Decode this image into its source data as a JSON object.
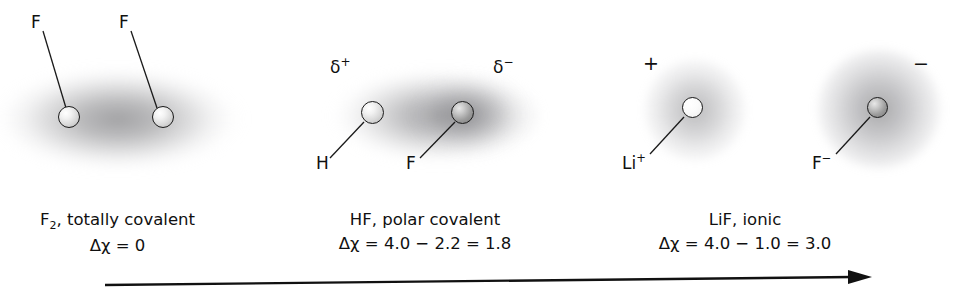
{
  "figure": {
    "background_color": "#ffffff",
    "ink_color": "#101010"
  },
  "panels": [
    {
      "id": "f2",
      "molecule": "F2",
      "bond_type": "totally covalent",
      "caption_line1": "F2, totally covalent",
      "caption_line1_formula_prefix": "F",
      "caption_line1_formula_sub": "2",
      "caption_line1_rest": ", totally covalent",
      "caption_line2": "Δχ = 0",
      "electronegativity_difference": 0,
      "cloud_shape": "single symmetric ellipse",
      "atoms": [
        {
          "label": "F",
          "charge_label": "",
          "shade": "light"
        },
        {
          "label": "F",
          "charge_label": "",
          "shade": "light"
        }
      ],
      "charge_labels": []
    },
    {
      "id": "hf",
      "molecule": "HF",
      "bond_type": "polar covalent",
      "caption_line1": "HF, polar covalent",
      "caption_line2": "Δχ = 4.0 − 2.2 = 1.8",
      "electronegativity_values": [
        4.0,
        2.2
      ],
      "electronegativity_difference": 1.8,
      "cloud_shape": "single ellipse, denser toward fluorine",
      "atoms": [
        {
          "label": "H",
          "charge_label": "δ+",
          "shade": "light"
        },
        {
          "label": "F",
          "charge_label": "δ−",
          "shade": "dark"
        }
      ],
      "charge_labels": [
        {
          "symbol": "δ",
          "sign": "+"
        },
        {
          "symbol": "δ",
          "sign": "−"
        }
      ]
    },
    {
      "id": "lif",
      "molecule": "LiF",
      "bond_type": "ionic",
      "caption_line1": "LiF, ionic",
      "caption_line2": "Δχ = 4.0 − 1.0 = 3.0",
      "electronegativity_values": [
        4.0,
        1.0
      ],
      "electronegativity_difference": 3.0,
      "cloud_shape": "two separate spherical ion clouds",
      "atoms": [
        {
          "label": "Li",
          "charge_label": "+",
          "shade": "hollow"
        },
        {
          "label": "F",
          "charge_label": "−",
          "shade": "dark"
        }
      ],
      "charge_labels": [
        {
          "symbol": "",
          "sign": "+"
        },
        {
          "symbol": "",
          "sign": "−"
        }
      ]
    }
  ],
  "atom_labels": {
    "f2_left": "F",
    "f2_right": "F",
    "hf_left": "H",
    "hf_right": "F",
    "lif_left_base": "Li",
    "lif_left_sup": "+",
    "lif_right_base": "F",
    "lif_right_sup": "−"
  },
  "charge_annotations": {
    "hf_delta_plus_symbol": "δ",
    "hf_delta_plus_sign": "+",
    "hf_delta_minus_symbol": "δ",
    "hf_delta_minus_sign": "−",
    "lif_plus": "+",
    "lif_minus": "−"
  },
  "captions": {
    "f2_line1_prefix": "F",
    "f2_line1_sub": "2",
    "f2_line1_suffix": ", totally covalent",
    "f2_line2": "Δχ = 0",
    "hf_line1": "HF, polar covalent",
    "hf_line2": "Δχ = 4.0 − 2.2 = 1.8",
    "lif_line1": "LiF, ionic",
    "lif_line2": "Δχ = 4.0 − 1.0 = 3.0"
  },
  "arrow": {
    "description": "horizontal arrow pointing right, indicating increasing bond polarity",
    "direction": "right",
    "label": ""
  }
}
